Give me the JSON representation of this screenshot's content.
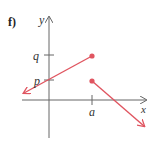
{
  "part_label": "f)",
  "axes": {
    "x_label": "x",
    "y_label": "y",
    "axis_color": "#666666"
  },
  "ticks": {
    "y_ticks": [
      "q",
      "p"
    ],
    "x_ticks": [
      "a"
    ]
  },
  "graph": {
    "line_color": "#e05560",
    "segments": [
      {
        "name": "left-piece",
        "from": "arrow toward left (x→-∞)",
        "to": "x=a, y=q (closed dot)",
        "passes_through": "(0, p)"
      },
      {
        "name": "right-piece",
        "from": "x=a, y=p (closed dot)",
        "to": "arrow toward lower right"
      }
    ]
  }
}
